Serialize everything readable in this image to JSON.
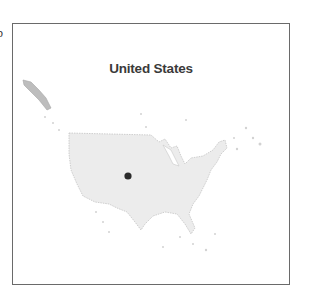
{
  "edge_text": "b",
  "map": {
    "title": "United States",
    "marker": {
      "label": "location-marker",
      "color": "#2b2b2b"
    },
    "land_fill": "#ececec",
    "land_stroke": "#c4c4c4",
    "border_color": "#6a6a6a"
  }
}
